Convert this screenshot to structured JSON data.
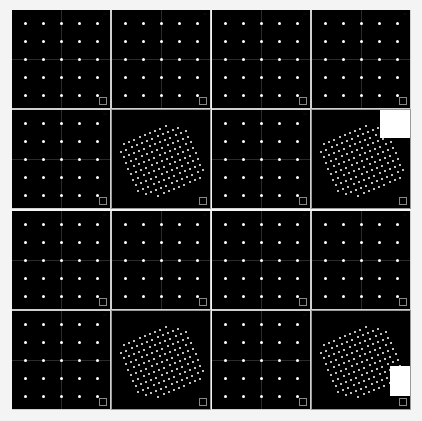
{
  "view": {
    "background": "#f4f4f4",
    "panel_background": "#000000",
    "dot_color": "#ffffff",
    "layout": "2x2 quadrants, each a 2x2 set of panels (three 5x5 dot grid views + one 3D perspective lattice view)"
  },
  "quadrants": [
    {
      "id": "q1",
      "x": 12,
      "y": 10,
      "panels": [
        "grid",
        "grid",
        "grid",
        "3d"
      ],
      "occluder": null
    },
    {
      "id": "q2",
      "x": 212,
      "y": 10,
      "panels": [
        "grid",
        "grid",
        "grid",
        "3d"
      ],
      "occluder": {
        "panel": 3,
        "x": 68,
        "y": 0,
        "w": 30,
        "h": 28
      }
    },
    {
      "id": "q3",
      "x": 12,
      "y": 211,
      "panels": [
        "grid",
        "grid",
        "grid",
        "3d"
      ],
      "occluder": null
    },
    {
      "id": "q4",
      "x": 212,
      "y": 211,
      "panels": [
        "grid",
        "grid",
        "grid",
        "3d"
      ],
      "occluder": {
        "panel": 3,
        "x": 78,
        "y": 55,
        "w": 22,
        "h": 30
      }
    }
  ],
  "grid": {
    "rows": 5,
    "cols": 5
  },
  "lattice3d": {
    "rows": 11,
    "cols": 13
  },
  "labels": {
    "panel_tag": "····"
  }
}
